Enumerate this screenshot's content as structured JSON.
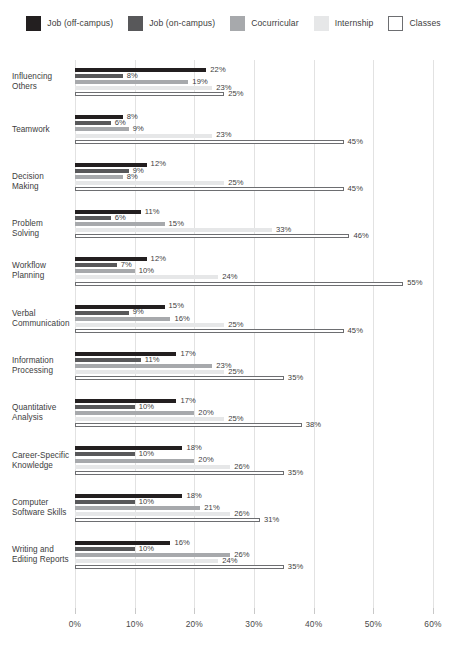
{
  "legend": {
    "items": [
      {
        "label": "Job (off-campus)",
        "color": "#231f20",
        "border": "#231f20",
        "name": "legend-job-off-campus"
      },
      {
        "label": "Job (on-campus)",
        "color": "#58585a",
        "border": "#58585a",
        "name": "legend-job-on-campus"
      },
      {
        "label": "Cocurricular",
        "color": "#a7a9ac",
        "border": "#a7a9ac",
        "name": "legend-cocurricular"
      },
      {
        "label": "Internship",
        "color": "#e6e7e8",
        "border": "#e6e7e8",
        "name": "legend-internship"
      },
      {
        "label": "Classes",
        "color": "#ffffff",
        "border": "#6d6e71",
        "name": "legend-classes"
      }
    ]
  },
  "axis": {
    "ticks": [
      "0%",
      "10%",
      "20%",
      "30%",
      "40%",
      "50%",
      "60%"
    ],
    "tick_values": [
      0,
      10,
      20,
      30,
      40,
      50,
      60
    ]
  },
  "chart_data": {
    "type": "bar",
    "orientation": "horizontal",
    "title": "",
    "subtitle": "",
    "xlabel": "",
    "ylabel": "",
    "xlim": [
      0,
      60
    ],
    "grid": true,
    "legend_position": "top",
    "value_suffix": "%",
    "categories": [
      "Influencing Others",
      "Teamwork",
      "Decision Making",
      "Problem Solving",
      "Workflow Planning",
      "Verbal Communication",
      "Information Processing",
      "Quantitative Analysis",
      "Career-Specific Knowledge",
      "Computer Software Skills",
      "Writing and Editing Reports"
    ],
    "category_lines": [
      [
        "Influencing",
        "Others"
      ],
      [
        "Teamwork"
      ],
      [
        "Decision Making"
      ],
      [
        "Problem Solving"
      ],
      [
        "Workflow",
        "Planning"
      ],
      [
        "Verbal",
        "Communication"
      ],
      [
        "Information",
        "Processing"
      ],
      [
        "Quantitative",
        "Analysis"
      ],
      [
        "Career-Specific",
        "Knowledge"
      ],
      [
        "Computer",
        "Software Skills"
      ],
      [
        "Writing and",
        "Editing Reports"
      ]
    ],
    "series": [
      {
        "name": "Job (off-campus)",
        "color": "#231f20",
        "border": "#231f20",
        "values": [
          22,
          8,
          12,
          11,
          12,
          15,
          17,
          17,
          18,
          18,
          16
        ]
      },
      {
        "name": "Job (on-campus)",
        "color": "#58585a",
        "border": "#58585a",
        "values": [
          8,
          6,
          9,
          6,
          7,
          9,
          11,
          10,
          10,
          10,
          10
        ]
      },
      {
        "name": "Cocurricular",
        "color": "#a7a9ac",
        "border": "#a7a9ac",
        "values": [
          19,
          9,
          8,
          15,
          10,
          16,
          23,
          20,
          20,
          21,
          26
        ]
      },
      {
        "name": "Internship",
        "color": "#e6e7e8",
        "border": "#e6e7e8",
        "values": [
          23,
          23,
          25,
          33,
          24,
          25,
          25,
          25,
          26,
          26,
          24
        ]
      },
      {
        "name": "Classes",
        "color": "#ffffff",
        "border": "#6d6e71",
        "values": [
          25,
          45,
          45,
          46,
          55,
          45,
          35,
          38,
          35,
          31,
          35
        ]
      }
    ]
  }
}
